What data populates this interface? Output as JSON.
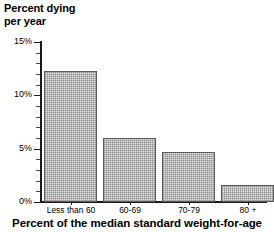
{
  "chart_data": {
    "type": "bar",
    "title": "Percent dying per year",
    "ylabel_line1": "Percent dying",
    "ylabel_line2": "per year",
    "xlabel": "Percent of the median standard weight-for-age",
    "categories": [
      "Less than 60",
      "60-69",
      "70-79",
      "80 +"
    ],
    "values": [
      12.3,
      6.0,
      4.7,
      1.6
    ],
    "ylim": [
      0,
      15
    ],
    "ytick_labels": [
      "0%",
      "5%",
      "10%",
      "15%"
    ],
    "ytick_values": [
      0,
      5,
      10,
      15
    ],
    "yminor_step": 1,
    "grid": false,
    "legend": "none",
    "bar_fill_color": "#e9e9e9",
    "bar_edge_color": "#5a5a5a",
    "axis_color": "#1a1a1a",
    "background_color": "#ffffff"
  }
}
